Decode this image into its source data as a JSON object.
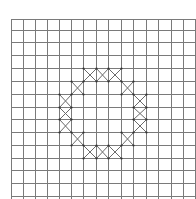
{
  "diagram": {
    "type": "grid-pattern",
    "grid": {
      "x_lines": [
        11,
        23,
        35,
        47,
        59,
        71,
        83,
        96,
        108,
        121,
        133,
        146,
        158,
        171,
        183,
        195
      ],
      "y_lines": [
        19,
        30,
        42,
        55,
        68,
        81,
        94,
        107,
        119,
        132,
        145,
        158,
        170,
        183,
        196
      ],
      "line_color": "#7a7a7a",
      "background": "#ffffff"
    },
    "crossed_cells": [
      {
        "row": 4,
        "col": 6
      },
      {
        "row": 4,
        "col": 7
      },
      {
        "row": 4,
        "col": 8
      },
      {
        "row": 5,
        "col": 5
      },
      {
        "row": 5,
        "col": 9
      },
      {
        "row": 6,
        "col": 4
      },
      {
        "row": 6,
        "col": 10
      },
      {
        "row": 7,
        "col": 4
      },
      {
        "row": 7,
        "col": 10
      },
      {
        "row": 8,
        "col": 4
      },
      {
        "row": 8,
        "col": 10
      },
      {
        "row": 9,
        "col": 5
      },
      {
        "row": 9,
        "col": 9
      },
      {
        "row": 10,
        "col": 6
      },
      {
        "row": 10,
        "col": 7
      },
      {
        "row": 10,
        "col": 8
      }
    ],
    "cross_color": "#6a6a6a",
    "vertex_dot_color": "#333333"
  }
}
